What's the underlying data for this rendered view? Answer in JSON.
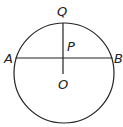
{
  "diagram": {
    "type": "circle-geometry",
    "labels": {
      "Q": "Q",
      "P": "P",
      "A": "A",
      "B": "B",
      "O": "O"
    },
    "colors": {
      "stroke": "#222222",
      "background": "#ffffff"
    }
  }
}
